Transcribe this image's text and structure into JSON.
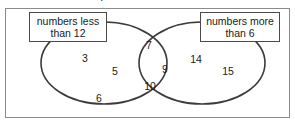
{
  "figure": {
    "type": "venn-diagram",
    "clipped_text_above": "g",
    "labels": {
      "left": {
        "line1": "numbers less",
        "line2": "than 12"
      },
      "right": {
        "line1": "numbers more",
        "line2": "than 6"
      }
    },
    "regions": {
      "left_only": {
        "name": "numbers less than 12 only",
        "values": [
          "3",
          "5",
          "6"
        ]
      },
      "intersection": {
        "name": "both less than 12 and more than 6",
        "values": [
          "7",
          "9",
          "10"
        ]
      },
      "right_only": {
        "name": "numbers more than 6 only",
        "values": [
          "14",
          "15"
        ]
      }
    },
    "numbers": [
      {
        "value": "3",
        "region": "left_only",
        "x": 85,
        "y": 53
      },
      {
        "value": "5",
        "region": "left_only",
        "x": 115,
        "y": 66
      },
      {
        "value": "6",
        "region": "left_only",
        "x": 99,
        "y": 93
      },
      {
        "value": "7",
        "region": "intersection",
        "x": 149,
        "y": 40
      },
      {
        "value": "9",
        "region": "intersection",
        "x": 165,
        "y": 64
      },
      {
        "value": "10",
        "region": "intersection",
        "x": 150,
        "y": 81
      },
      {
        "value": "14",
        "region": "right_only",
        "x": 196,
        "y": 54
      },
      {
        "value": "15",
        "region": "right_only",
        "x": 228,
        "y": 66
      }
    ],
    "colors": {
      "stroke": "#3c3c3c",
      "frame": "#8b8b8b",
      "text": "#1a1a1a",
      "background": "#ffffff"
    }
  }
}
